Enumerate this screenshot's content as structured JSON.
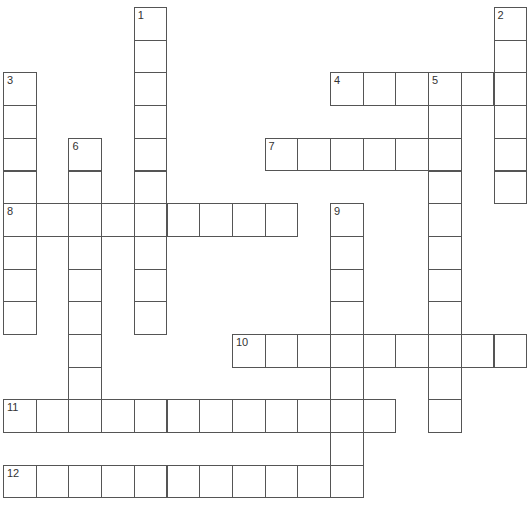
{
  "puzzle": {
    "grid": {
      "origin_x": 3,
      "origin_y": 7,
      "cell_size": 32.7,
      "border_color": "#555555",
      "cell_color": "#ffffff"
    },
    "entries": [
      {
        "number": "1",
        "direction": "down",
        "row": 0,
        "col": 4,
        "length": 10
      },
      {
        "number": "2",
        "direction": "down",
        "row": 0,
        "col": 15,
        "length": 6
      },
      {
        "number": "3",
        "direction": "down",
        "row": 2,
        "col": 0,
        "length": 8
      },
      {
        "number": "4",
        "direction": "across",
        "row": 2,
        "col": 10,
        "length": 6
      },
      {
        "number": "5",
        "direction": "down",
        "row": 2,
        "col": 13,
        "length": 11
      },
      {
        "number": "6",
        "direction": "down",
        "row": 4,
        "col": 2,
        "length": 9
      },
      {
        "number": "7",
        "direction": "across",
        "row": 4,
        "col": 8,
        "length": 6
      },
      {
        "number": "8",
        "direction": "across",
        "row": 6,
        "col": 0,
        "length": 9
      },
      {
        "number": "9",
        "direction": "down",
        "row": 6,
        "col": 10,
        "length": 9
      },
      {
        "number": "10",
        "direction": "across",
        "row": 10,
        "col": 7,
        "length": 9
      },
      {
        "number": "11",
        "direction": "across",
        "row": 12,
        "col": 0,
        "length": 12
      },
      {
        "number": "12",
        "direction": "across",
        "row": 14,
        "col": 0,
        "length": 11
      }
    ]
  }
}
